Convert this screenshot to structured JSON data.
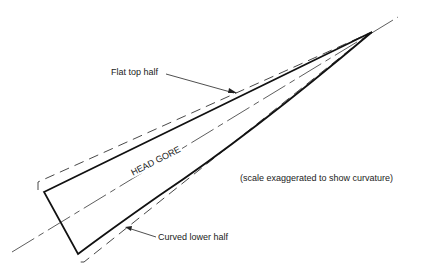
{
  "diagram": {
    "title_label": "HEAD GORE",
    "labels": {
      "flat_top": "Flat top half",
      "curved_lower": "Curved lower half",
      "note": "(scale exaggerated to show curvature)"
    },
    "colors": {
      "line": "#1a1a1a",
      "dashed": "#333333",
      "background": "#ffffff"
    }
  }
}
